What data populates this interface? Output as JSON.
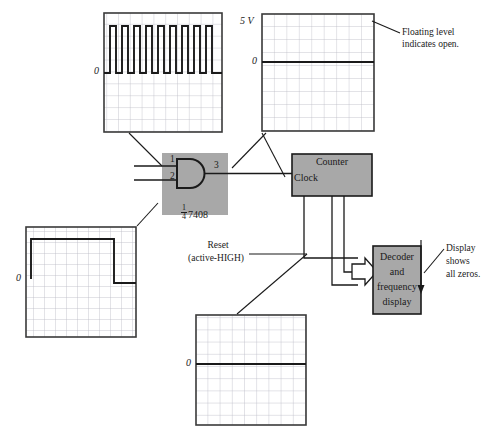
{
  "figure": {
    "background": "#ffffff",
    "ink": "#1a1a1a",
    "block_fill": "#a8a8a8",
    "grid_line": "#b9b9c4",
    "trace_color": "#1a1a1a"
  },
  "scopes": [
    {
      "id": "scope-clock-input",
      "name": "clock-input-scope",
      "x": 104,
      "y": 13,
      "w": 118,
      "h": 119,
      "cols": 10,
      "rows": 10,
      "axis_labels": {
        "zero": "0",
        "top": ""
      },
      "waveform": {
        "type": "pulse-train",
        "description": "continuous square wave pulse train",
        "pulses": 9,
        "baseline_row": 5,
        "high_row": 1.1,
        "duty_pct": 45
      }
    },
    {
      "id": "scope-floating",
      "name": "floating-level-scope",
      "x": 262,
      "y": 14,
      "w": 112,
      "h": 117,
      "cols": 9,
      "rows": 9,
      "axis_labels": {
        "zero": "0",
        "top": "5 V"
      },
      "waveform": {
        "type": "dc-level",
        "description": "flat floating level just above zero",
        "level_row": 3.0
      }
    },
    {
      "id": "scope-reset",
      "name": "reset-pulse-scope",
      "x": 26,
      "y": 227,
      "w": 110,
      "h": 110,
      "cols": 10,
      "rows": 10,
      "axis_labels": {
        "zero": "0",
        "top": ""
      },
      "waveform": {
        "type": "single-pulse",
        "description": "HIGH level that returns low near right edge",
        "rise_col": 0.6,
        "fall_col": 8.3,
        "high_row": 1.1,
        "low_row": 4.6
      }
    },
    {
      "id": "scope-gate-output",
      "name": "gate-output-scope",
      "x": 196,
      "y": 315,
      "w": 110,
      "h": 110,
      "cols": 9,
      "rows": 9,
      "axis_labels": {
        "zero": "0",
        "top": ""
      },
      "waveform": {
        "type": "dc-level",
        "description": "flat line held at zero",
        "level_row": 4.0
      }
    }
  ],
  "chip": {
    "name": "and-gate-7408",
    "x": 162,
    "y": 153,
    "w": 66,
    "h": 62,
    "type": "AND",
    "part_number": "7408",
    "fraction_numerator": "1",
    "fraction_denominator": "4",
    "pins": [
      {
        "label": "1",
        "role": "input-a"
      },
      {
        "label": "2",
        "role": "input-b"
      },
      {
        "label": "3",
        "role": "output-y"
      }
    ]
  },
  "blocks": [
    {
      "id": "counter-block",
      "name": "counter-block",
      "x": 292,
      "y": 154,
      "w": 80,
      "h": 42,
      "title": "Counter",
      "port_label": "Clock"
    },
    {
      "id": "decoder-block",
      "name": "decoder-display-block",
      "x": 373,
      "y": 246,
      "w": 48,
      "h": 68,
      "lines": [
        "Decoder",
        "and",
        "frequency",
        "display"
      ]
    }
  ],
  "annotations": [
    {
      "id": "note-floating",
      "name": "floating-level-note",
      "x": 402,
      "y": 27,
      "lines": [
        "Floating level",
        "indicates open."
      ]
    },
    {
      "id": "note-display",
      "name": "display-zeros-note",
      "x": 446,
      "y": 243,
      "lines": [
        "Display",
        "shows",
        "all zeros."
      ]
    },
    {
      "id": "note-reset",
      "name": "reset-signal-label",
      "x": 186,
      "y": 240,
      "lines": [
        "Reset",
        "(active-HIGH)"
      ]
    }
  ],
  "connections": [
    {
      "name": "clock-scope-probe-to-pin1",
      "from": "scope-clock-input",
      "to": "and-gate-pin-1"
    },
    {
      "name": "floating-scope-probe-to-pin2",
      "from": "scope-floating",
      "to": "and-gate-pin-2"
    },
    {
      "name": "reset-scope-probe-to-pin2",
      "from": "scope-reset",
      "to": "and-gate-pin-2"
    },
    {
      "name": "gate-output-to-counter-clock",
      "from": "and-gate-pin-3",
      "to": "counter-block"
    },
    {
      "name": "gate-output-probe-to-scope",
      "from": "and-gate-pin-3",
      "to": "scope-gate-output"
    },
    {
      "name": "counter-bus-to-decoder",
      "from": "counter-block",
      "to": "decoder-block",
      "style": "hollow-arrow-bus"
    },
    {
      "name": "display-note-pointer",
      "from": "note-display",
      "to": "decoder-block"
    },
    {
      "name": "floating-note-pointer",
      "from": "note-floating",
      "to": "scope-floating"
    }
  ]
}
